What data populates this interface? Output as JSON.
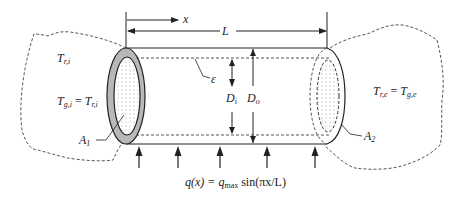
{
  "diagram": {
    "labels": {
      "x": "x",
      "L": "L",
      "epsilon": "ε",
      "Di_main": "D",
      "Di_sub": "i",
      "Do_main": "D",
      "Do_sub": "o",
      "Tri_main": "T",
      "Tri_sub": "r,i",
      "Tgi_lhs_main": "T",
      "Tgi_lhs_sub": "g,i",
      "Tgi_eq": " = ",
      "Tgi_rhs_main": "T",
      "Tgi_rhs_sub": "r,i",
      "Tre_lhs_main": "T",
      "Tre_lhs_sub": "r,e",
      "Tre_eq": " = ",
      "Tre_rhs_main": "T",
      "Tre_rhs_sub": "g,e",
      "A1_main": "A",
      "A1_sub": "1",
      "A2_main": "A",
      "A2_sub": "2",
      "flux_lhs": "q(x) = q",
      "flux_sub": "max",
      "flux_rhs": " sin(πx/L)"
    },
    "colors": {
      "line": "#222222",
      "wall_fill": "#b8b8b8",
      "dashed": "#555555",
      "dots": "#9a9a9a"
    },
    "heat_flux_arrows": 5
  }
}
